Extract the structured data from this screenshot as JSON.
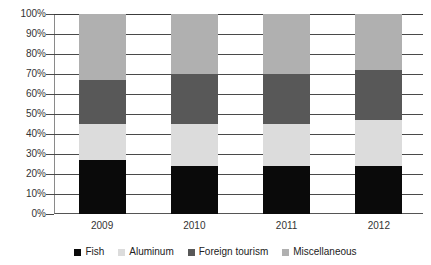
{
  "chart_data": {
    "type": "bar",
    "subtype": "stacked-100-percent",
    "title": "",
    "xlabel": "",
    "ylabel": "",
    "categories": [
      "2009",
      "2010",
      "2011",
      "2012"
    ],
    "ylim": [
      0,
      100
    ],
    "ytick_labels": [
      "0%",
      "10%",
      "20%",
      "30%",
      "40%",
      "50%",
      "60%",
      "70%",
      "80%",
      "90%",
      "100%"
    ],
    "ytick_values": [
      0,
      10,
      20,
      30,
      40,
      50,
      60,
      70,
      80,
      90,
      100
    ],
    "grid": true,
    "legend_position": "bottom",
    "series": [
      {
        "name": "Fish",
        "color": "#0a0a0a",
        "values": [
          27,
          24,
          24,
          24
        ]
      },
      {
        "name": "Aluminum",
        "color": "#dcdcdc",
        "values": [
          18,
          21,
          21,
          23
        ]
      },
      {
        "name": "Foreign tourism",
        "color": "#585858",
        "values": [
          22,
          25,
          25,
          25
        ]
      },
      {
        "name": "Miscellaneous",
        "color": "#b0b0b0",
        "values": [
          33,
          30,
          30,
          28
        ]
      }
    ]
  },
  "axis": {
    "tick_0": "0%",
    "tick_10": "10%",
    "tick_20": "20%",
    "tick_30": "30%",
    "tick_40": "40%",
    "tick_50": "50%",
    "tick_60": "60%",
    "tick_70": "70%",
    "tick_80": "80%",
    "tick_90": "90%",
    "tick_100": "100%"
  },
  "xaxis": {
    "label_0": "2009",
    "label_1": "2010",
    "label_2": "2011",
    "label_3": "2012"
  },
  "legend": {
    "item_0": "Fish",
    "item_1": "Aluminum",
    "item_2": "Foreign tourism",
    "item_3": "Miscellaneous"
  },
  "title_sliver": ""
}
